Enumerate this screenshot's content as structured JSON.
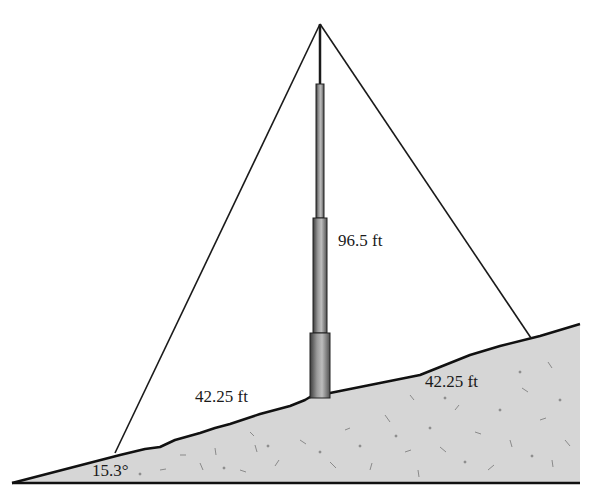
{
  "diagram": {
    "type": "tower-on-slope",
    "labels": {
      "tower_height": "96.5 ft",
      "left_distance": "42.25 ft",
      "right_distance": "42.25 ft",
      "slope_angle": "15.3°"
    },
    "colors": {
      "ground_fill": "#d4d4d4",
      "ground_edge": "#111111",
      "wire": "#1a1a1a",
      "tower_dark": "#4a4a4a",
      "tower_light": "#bdbdbd",
      "speckle": "#8a8a8a"
    }
  }
}
